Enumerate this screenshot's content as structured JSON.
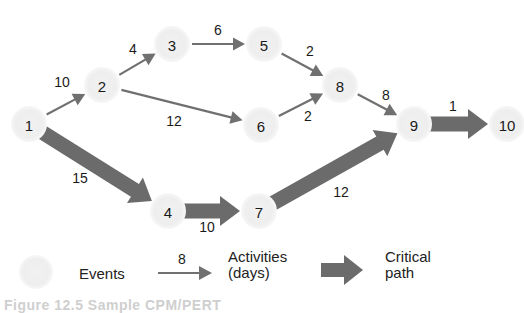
{
  "diagram": {
    "type": "CPM/PERT network",
    "nodes": [
      {
        "id": "1",
        "label": "1",
        "x": 29,
        "y": 124
      },
      {
        "id": "2",
        "label": "2",
        "x": 102,
        "y": 85
      },
      {
        "id": "3",
        "label": "3",
        "x": 172,
        "y": 44
      },
      {
        "id": "4",
        "label": "4",
        "x": 168,
        "y": 211
      },
      {
        "id": "5",
        "label": "5",
        "x": 264,
        "y": 44
      },
      {
        "id": "6",
        "label": "6",
        "x": 261,
        "y": 125
      },
      {
        "id": "7",
        "label": "7",
        "x": 259,
        "y": 211
      },
      {
        "id": "8",
        "label": "8",
        "x": 340,
        "y": 85
      },
      {
        "id": "9",
        "label": "9",
        "x": 414,
        "y": 124
      },
      {
        "id": "10",
        "label": "10",
        "x": 507,
        "y": 124
      }
    ],
    "edges": [
      {
        "from": "1",
        "to": "2",
        "days": "10",
        "critical": false,
        "lx": 62,
        "ly": 82
      },
      {
        "from": "2",
        "to": "3",
        "days": "4",
        "critical": false,
        "lx": 133,
        "ly": 49
      },
      {
        "from": "3",
        "to": "5",
        "days": "6",
        "critical": false,
        "lx": 218,
        "ly": 30
      },
      {
        "from": "2",
        "to": "6",
        "days": "12",
        "critical": false,
        "lx": 174,
        "ly": 121
      },
      {
        "from": "5",
        "to": "8",
        "days": "2",
        "critical": false,
        "lx": 310,
        "ly": 51
      },
      {
        "from": "6",
        "to": "8",
        "days": "2",
        "critical": false,
        "lx": 308,
        "ly": 116
      },
      {
        "from": "8",
        "to": "9",
        "days": "8",
        "critical": false,
        "lx": 386,
        "ly": 95
      },
      {
        "from": "1",
        "to": "4",
        "days": "15",
        "critical": true,
        "lx": 80,
        "ly": 178
      },
      {
        "from": "4",
        "to": "7",
        "days": "10",
        "critical": true,
        "lx": 207,
        "ly": 227
      },
      {
        "from": "7",
        "to": "9",
        "days": "12",
        "critical": true,
        "lx": 341,
        "ly": 192
      },
      {
        "from": "9",
        "to": "10",
        "days": "1",
        "critical": true,
        "lx": 453,
        "ly": 106
      }
    ]
  },
  "legend": {
    "events_label": "Events",
    "activity_example_days": "8",
    "activities_label_line1": "Activities",
    "activities_label_line2": "(days)",
    "critical_label_line1": "Critical",
    "critical_label_line2": "path"
  },
  "caption": "Figure 12.5 Sample CPM/PERT",
  "colors": {
    "node_fill": "#eeeeee",
    "arrow": "#707070",
    "critical_arrow": "#6b6b6b",
    "text": "#1a1a1a"
  }
}
